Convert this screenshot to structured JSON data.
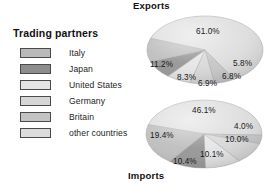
{
  "legend": {
    "title": "Trading partners",
    "items": [
      {
        "label": "Italy",
        "color": "#b9b9b9",
        "icon": "legend-swatch-icon"
      },
      {
        "label": "Japan",
        "color": "#8d8d8d",
        "icon": "legend-swatch-icon"
      },
      {
        "label": "United States",
        "color": "#e4e4e4",
        "icon": "legend-swatch-icon"
      },
      {
        "label": "Germany",
        "color": "#d6d6d6",
        "icon": "legend-swatch-icon"
      },
      {
        "label": "Britain",
        "color": "#c3c3c3",
        "icon": "legend-swatch-icon"
      },
      {
        "label": "other countries",
        "color": "#dcdcdc",
        "icon": "legend-swatch-icon"
      }
    ]
  },
  "titles": {
    "exports": "Exports",
    "imports": "Imports"
  },
  "chart_data": [
    {
      "type": "pie",
      "title": "Exports",
      "categories": [
        "other countries",
        "Britain",
        "Germany",
        "United States",
        "Japan",
        "Italy"
      ],
      "values": [
        61.0,
        5.8,
        6.8,
        6.9,
        8.3,
        11.2
      ],
      "labels": [
        "61.0%",
        "5.8%",
        "6.8%",
        "6.9%",
        "8.3%",
        "11.2%"
      ],
      "colors": [
        "#dcdcdc",
        "#c3c3c3",
        "#d6d6d6",
        "#e4e4e4",
        "#8d8d8d",
        "#b9b9b9"
      ],
      "legend_position": "left",
      "grid": false
    },
    {
      "type": "pie",
      "title": "Imports",
      "categories": [
        "other countries",
        "Britain",
        "Germany",
        "United States",
        "Japan",
        "Italy"
      ],
      "values": [
        46.1,
        4.0,
        10.0,
        10.1,
        10.4,
        19.4
      ],
      "labels": [
        "46.1%",
        "4.0%",
        "10.0%",
        "10.1%",
        "10.4%",
        "19.4%"
      ],
      "colors": [
        "#dcdcdc",
        "#c3c3c3",
        "#d6d6d6",
        "#e4e4e4",
        "#8d8d8d",
        "#b9b9b9"
      ],
      "legend_position": "left",
      "grid": false
    }
  ]
}
